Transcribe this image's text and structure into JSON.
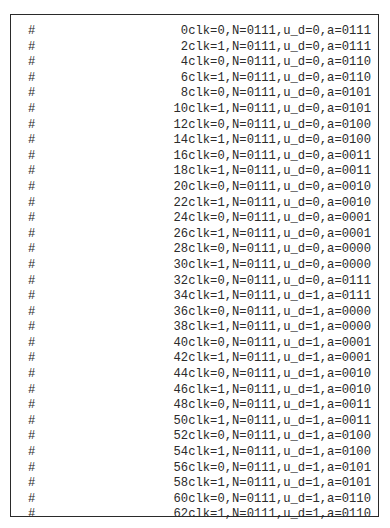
{
  "document": {
    "lines": [
      {
        "prefix": "#",
        "text": "0clk=0,N=0111,u_d=0,a=0111"
      },
      {
        "prefix": "#",
        "text": "2clk=1,N=0111,u_d=0,a=0111"
      },
      {
        "prefix": "#",
        "text": "4clk=0,N=0111,u_d=0,a=0110"
      },
      {
        "prefix": "#",
        "text": "6clk=1,N=0111,u_d=0,a=0110"
      },
      {
        "prefix": "#",
        "text": "8clk=0,N=0111,u_d=0,a=0101"
      },
      {
        "prefix": "#",
        "text": "10clk=1,N=0111,u_d=0,a=0101"
      },
      {
        "prefix": "#",
        "text": "12clk=0,N=0111,u_d=0,a=0100"
      },
      {
        "prefix": "#",
        "text": "14clk=1,N=0111,u_d=0,a=0100"
      },
      {
        "prefix": "#",
        "text": "16clk=0,N=0111,u_d=0,a=0011"
      },
      {
        "prefix": "#",
        "text": "18clk=1,N=0111,u_d=0,a=0011"
      },
      {
        "prefix": "#",
        "text": "20clk=0,N=0111,u_d=0,a=0010"
      },
      {
        "prefix": "#",
        "text": "22clk=1,N=0111,u_d=0,a=0010"
      },
      {
        "prefix": "#",
        "text": "24clk=0,N=0111,u_d=0,a=0001"
      },
      {
        "prefix": "#",
        "text": "26clk=1,N=0111,u_d=0,a=0001"
      },
      {
        "prefix": "#",
        "text": "28clk=0,N=0111,u_d=0,a=0000"
      },
      {
        "prefix": "#",
        "text": "30clk=1,N=0111,u_d=0,a=0000"
      },
      {
        "prefix": "#",
        "text": "32clk=0,N=0111,u_d=0,a=0111"
      },
      {
        "prefix": "#",
        "text": "34clk=1,N=0111,u_d=1,a=0111"
      },
      {
        "prefix": "#",
        "text": "36clk=0,N=0111,u_d=1,a=0000"
      },
      {
        "prefix": "#",
        "text": "38clk=1,N=0111,u_d=1,a=0000"
      },
      {
        "prefix": "#",
        "text": "40clk=0,N=0111,u_d=1,a=0001"
      },
      {
        "prefix": "#",
        "text": "42clk=1,N=0111,u_d=1,a=0001"
      },
      {
        "prefix": "#",
        "text": "44clk=0,N=0111,u_d=1,a=0010"
      },
      {
        "prefix": "#",
        "text": "46clk=1,N=0111,u_d=1,a=0010"
      },
      {
        "prefix": "#",
        "text": "48clk=0,N=0111,u_d=1,a=0011"
      },
      {
        "prefix": "#",
        "text": "50clk=1,N=0111,u_d=1,a=0011"
      },
      {
        "prefix": "#",
        "text": "52clk=0,N=0111,u_d=1,a=0100"
      },
      {
        "prefix": "#",
        "text": "54clk=1,N=0111,u_d=1,a=0100"
      },
      {
        "prefix": "#",
        "text": "56clk=0,N=0111,u_d=1,a=0101"
      },
      {
        "prefix": "#",
        "text": "58clk=1,N=0111,u_d=1,a=0101"
      },
      {
        "prefix": "#",
        "text": "60clk=0,N=0111,u_d=1,a=0110"
      },
      {
        "prefix": "#",
        "text": "62clk=1,N=0111,u_d=1,a=0110"
      }
    ]
  }
}
